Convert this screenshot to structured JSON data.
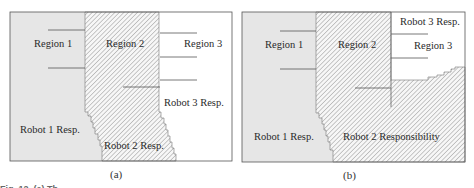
{
  "panel_a": {
    "caption": "(a)",
    "labels": {
      "region1": "Region 1",
      "region2": "Region 2",
      "region3": "Region 3",
      "robot1": "Robot 1 Resp.",
      "robot2": "Robot 2 Resp.",
      "robot3": "Robot 3 Resp."
    }
  },
  "panel_b": {
    "caption": "(b)",
    "labels": {
      "region1": "Region 1",
      "region2": "Region 2",
      "region3": "Region 3",
      "robot1": "Robot 1 Resp.",
      "robot2": "Robot 2 Responsibility",
      "robot3": "Robot 3 Resp."
    }
  },
  "figure_caption_fragment": "Fig. 12. (a) Th",
  "colors": {
    "robot1_fill": "#e6e6e6",
    "hatch_line": "#8a8a8a",
    "border": "#555555"
  }
}
